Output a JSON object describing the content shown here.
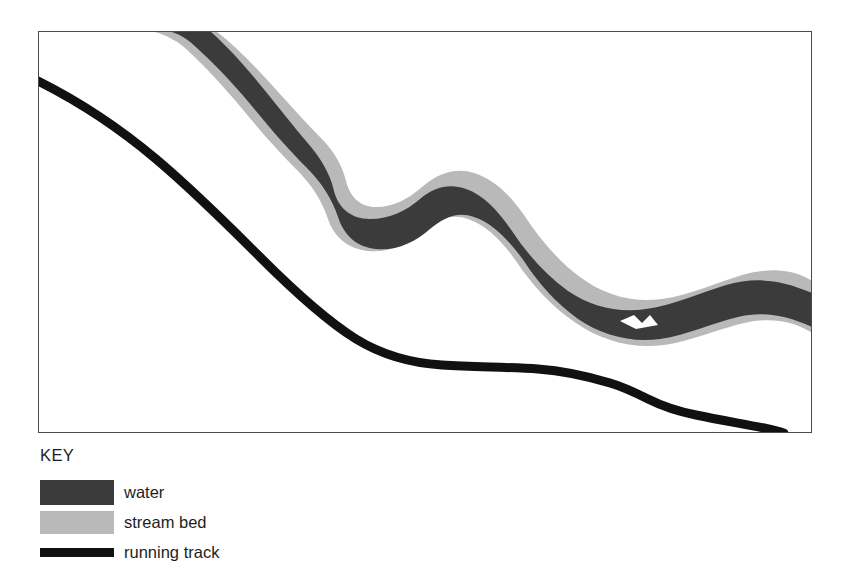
{
  "figure": {
    "frame": {
      "border_color": "#4a4a4a",
      "background": "#ffffff"
    }
  },
  "key": {
    "title": "KEY",
    "items": [
      {
        "label": "water",
        "swatch": "filled-rect",
        "color": "#3b3b3b"
      },
      {
        "label": "stream bed",
        "swatch": "filled-rect",
        "color": "#b9b9b9"
      },
      {
        "label": "running track",
        "swatch": "thick-line",
        "color": "#111111"
      }
    ]
  },
  "map_data": {
    "type": "map",
    "description": "Plan-view map showing a meandering stream (dark water channel inside a lighter stream bed) running from the upper-left corner to the right edge, with a running track curving from the left edge down to the bottom-right corner.",
    "colors": {
      "water": "#3b3b3b",
      "stream_bed": "#b9b9b9",
      "running_track": "#111111",
      "frame": "#4a4a4a",
      "background": "#ffffff"
    },
    "features": [
      {
        "name": "stream bed",
        "kind": "band",
        "color": "#b9b9b9",
        "enters": "top edge near left",
        "exits": "right edge, lower third"
      },
      {
        "name": "water",
        "kind": "band",
        "color": "#3b3b3b",
        "enters": "top edge near left",
        "exits": "right edge, lower third"
      },
      {
        "name": "running track",
        "kind": "line",
        "color": "#111111",
        "enters": "left edge, upper area",
        "exits": "bottom edge near right corner"
      }
    ],
    "paths": {
      "stream_bed_outer_top": "M 58 0 L 110 0 C 160 30 205 70 248 120 C 270 148 296 162 330 155 C 372 146 408 160 438 196 C 470 234 510 262 560 270 C 610 278 660 258 700 248 C 740 238 772 252 790 268 L 790 300 C 760 286 722 276 688 286 C 648 298 604 316 560 306 C 508 294 466 262 434 226 C 404 192 374 178 336 186 C 296 194 262 178 236 148 C 196 100 150 58 104 28 Z",
      "water_band": "M 88 0 L 140 0 C 186 30 228 72 264 118 C 288 150 318 166 352 160 C 392 152 424 168 452 202 C 484 240 522 266 568 272 C 614 278 660 262 702 254 C 742 246 772 260 790 274 L 790 296 C 758 282 724 274 692 284 C 652 296 610 312 566 302 C 516 290 476 260 446 224 C 418 192 390 180 354 188 C 316 196 282 180 256 150 C 220 108 174 62 132 30 Z",
      "running_track": "M 0 50 C 70 80 140 124 200 178 C 250 222 296 268 340 302 C 384 336 436 352 494 352 C 540 352 576 350 606 354 C 638 358 664 372 700 382 C 726 390 742 396 756 402"
    }
  }
}
